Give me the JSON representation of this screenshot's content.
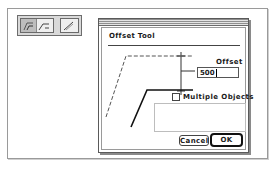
{
  "palette": {
    "tools": [
      {
        "name": "offset-curve-tool",
        "selected": true
      },
      {
        "name": "curve-tool",
        "selected": false
      },
      {
        "name": "line-tool",
        "selected": false
      }
    ]
  },
  "dialog": {
    "title": "Offset Tool",
    "offset": {
      "label": "Offset",
      "value": "500"
    },
    "multiple_objects": {
      "label": "Multiple Objects",
      "checked": false
    },
    "buttons": {
      "cancel": "Cancel",
      "ok": "OK"
    },
    "diagram": {
      "original_path": "dashed",
      "offset_path": "solid"
    }
  },
  "colors": {
    "background": "#ffffff",
    "border": "#5a5a5a",
    "text": "#1a1a1a",
    "palette_bg": "#d9d9d9",
    "selected_tool": "#bdbdbd"
  }
}
